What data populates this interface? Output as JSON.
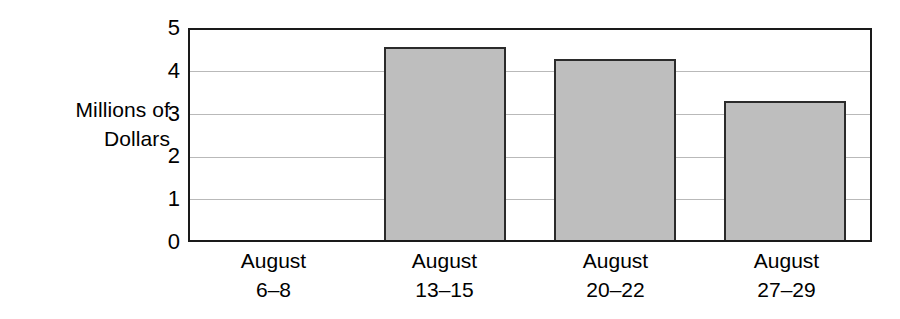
{
  "chart_data": {
    "type": "bar",
    "title": "",
    "xlabel": "",
    "ylabel": "Millions of\nDollars",
    "categories": [
      "August\n6–8",
      "August\n13–15",
      "August\n20–22",
      "August\n27–29"
    ],
    "category_lines": [
      {
        "month": "August",
        "days": "6–8"
      },
      {
        "month": "August",
        "days": "13–15"
      },
      {
        "month": "August",
        "days": "20–22"
      },
      {
        "month": "August",
        "days": "27–29"
      }
    ],
    "values": [
      0,
      4.6,
      4.3,
      3.3
    ],
    "ylim": [
      0,
      5
    ],
    "yticks": [
      5,
      4,
      3,
      2,
      1,
      0
    ],
    "ytick_labels": [
      "5",
      "4",
      "3",
      "2",
      "1",
      "0"
    ],
    "gridlines": [
      4,
      3,
      2,
      1
    ],
    "grid": true,
    "legend": "none",
    "colors": {
      "bar_fill": "#bebebe",
      "bar_outline": "#2b2b2b",
      "axis": "#1a1a1a",
      "gridline": "#b9b9b9",
      "text": "#000000",
      "background": "#ffffff"
    }
  }
}
